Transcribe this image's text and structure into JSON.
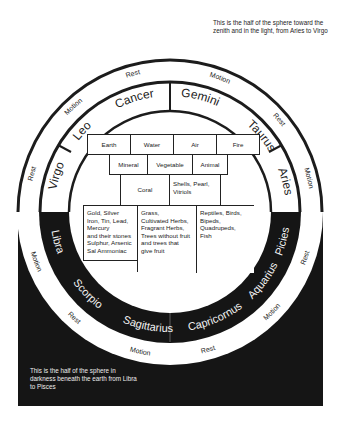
{
  "notes": {
    "top": "This is the half of the sphere toward the zenith and in the light, from Aries to Virgo",
    "bottom": "This is the half of the sphere in darkness beneath the earth from Libra to Pisces"
  },
  "outer_ring": {
    "labels_light": [
      "Rest",
      "Motion",
      "Motion",
      "Rest",
      "Motion",
      "Rest"
    ],
    "labels_dark": [
      "Motion",
      "Rest",
      "Motion",
      "Rest",
      "Motion",
      "Rest"
    ]
  },
  "zodiac": {
    "light": [
      "Virgo",
      "Leo",
      "Cancer",
      "Gemini",
      "Taurus",
      "Aries"
    ],
    "dark": [
      "Libra",
      "Scorpio",
      "Sagittarius",
      "Capricornus",
      "Aquarius",
      "Picies"
    ]
  },
  "elements": [
    "Earth",
    "Water",
    "Air",
    "Fire"
  ],
  "kingdoms": [
    "Mineral",
    "Vegetable",
    "Animal"
  ],
  "intermediates": [
    "Coral",
    "Shells, Pearl, Vitriols"
  ],
  "examples": {
    "mineral": [
      "Gold, Silver",
      "Iron, Tin, Lead,",
      "Mercury",
      "and their stones",
      "Sulphur, Arsenic",
      "Sal Ammoniac"
    ],
    "vegetable": [
      "Grass,",
      "Cultivated Herbs,",
      "Fragrant Herbs,",
      "Trees without fruit",
      "and trees that",
      "give fruit"
    ],
    "animal": [
      "Reptiles, Birds,",
      "Bipeds,",
      "Quadrupeds,",
      "Fish"
    ]
  },
  "colors": {
    "dark": "#151515",
    "light": "#ffffff",
    "stroke": "#1c1c1c"
  }
}
